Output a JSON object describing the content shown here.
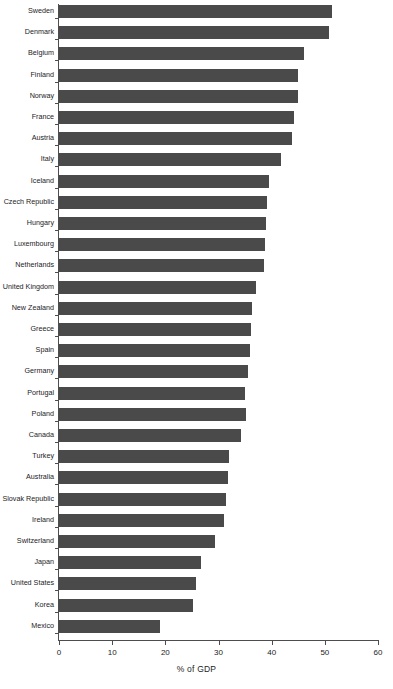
{
  "chart_data": {
    "type": "bar",
    "orientation": "horizontal",
    "title": "",
    "xlabel": "% of GDP",
    "ylabel": "",
    "xlim": [
      0,
      60
    ],
    "xticks": [
      0,
      10,
      20,
      30,
      40,
      50,
      60
    ],
    "grid": false,
    "legend": null,
    "bar_color": "#4a4a4a",
    "axis_color": "#4d4d4d",
    "categories": [
      "Sweden",
      "Denmark",
      "Belgium",
      "Finland",
      "Norway",
      "France",
      "Austria",
      "Italy",
      "Iceland",
      "Czech Republic",
      "Hungary",
      "Luxembourg",
      "Netherlands",
      "United Kingdom",
      "New Zealand",
      "Greece",
      "Spain",
      "Germany",
      "Portugal",
      "Poland",
      "Canada",
      "Turkey",
      "Australia",
      "Slovak Republic",
      "Ireland",
      "Switzerland",
      "Japan",
      "United States",
      "Korea",
      "Mexico"
    ],
    "values": [
      51.3,
      50.8,
      46.1,
      44.9,
      44.9,
      44.2,
      43.8,
      41.7,
      39.5,
      39.1,
      38.9,
      38.7,
      38.5,
      37.0,
      36.3,
      36.1,
      35.9,
      35.5,
      35.0,
      35.2,
      34.2,
      32.0,
      31.8,
      31.4,
      31.0,
      29.3,
      26.7,
      25.8,
      25.2,
      19.0
    ]
  }
}
